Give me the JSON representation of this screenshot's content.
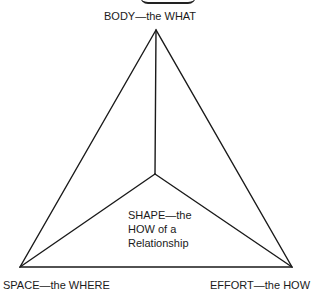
{
  "diagram": {
    "type": "triangle-with-center",
    "vertices": {
      "top": {
        "label": "BODY—the WHAT"
      },
      "bottom_left": {
        "label": "SPACE—the WHERE"
      },
      "bottom_right": {
        "label": "EFFORT—the HOW"
      }
    },
    "center": {
      "lines": [
        "SHAPE—the",
        "HOW of a",
        "Relationship"
      ]
    },
    "colors": {
      "stroke": "#1a1a1a",
      "background": "#ffffff"
    }
  }
}
